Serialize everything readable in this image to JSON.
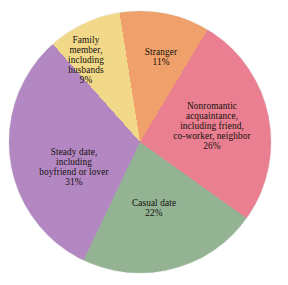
{
  "chart_data": {
    "type": "pie",
    "title": "",
    "subtitle": "",
    "xlabel": "",
    "ylabel": "",
    "legend_position": "none",
    "labels_on_slices": true,
    "grid": false,
    "units": "percent",
    "total": 99,
    "start_angle_deg": -9,
    "direction": "clockwise",
    "categories": [
      "Stranger",
      "Nonromantic acquaintance, including friend, co-worker, neighbor",
      "Casual date",
      "Steady date, including boyfriend or lover",
      "Family member, including husbands"
    ],
    "values": [
      11,
      26,
      22,
      31,
      9
    ],
    "colors": [
      "#F0A06A",
      "#E97F90",
      "#93B393",
      "#B387C2",
      "#F2D98A"
    ],
    "slices": [
      {
        "name": "stranger",
        "line1": "Stranger",
        "line2": "",
        "line3": "",
        "line4": "",
        "percent_label": "11%",
        "value": 11,
        "color": "#F0A06A"
      },
      {
        "name": "nonromantic-acquaintance",
        "line1": "Nonromantic",
        "line2": "acquaintance,",
        "line3": "including friend,",
        "line4": "co-worker, neighbor",
        "percent_label": "26%",
        "value": 26,
        "color": "#E97F90"
      },
      {
        "name": "casual-date",
        "line1": "Casual date",
        "line2": "",
        "line3": "",
        "line4": "",
        "percent_label": "22%",
        "value": 22,
        "color": "#93B393"
      },
      {
        "name": "steady-date",
        "line1": "Steady date,",
        "line2": "including",
        "line3": "boyfriend or lover",
        "line4": "",
        "percent_label": "31%",
        "value": 31,
        "color": "#B387C2"
      },
      {
        "name": "family-member",
        "line1": "Family",
        "line2": "member,",
        "line3": "including",
        "line4": "husbands",
        "percent_label": "9%",
        "value": 9,
        "color": "#F2D98A"
      }
    ]
  }
}
